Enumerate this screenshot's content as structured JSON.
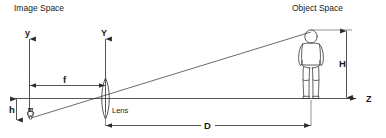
{
  "diagram": {
    "title_left": "Image Space",
    "title_right": "Object Space",
    "lens_label": "Lens",
    "axes": {
      "image_vertical": "y",
      "lens_vertical": "Y",
      "optical_horizontal": "Z"
    },
    "dimensions": {
      "focal_length": "f",
      "image_height": "h",
      "object_height": "H",
      "object_distance": "D"
    }
  }
}
